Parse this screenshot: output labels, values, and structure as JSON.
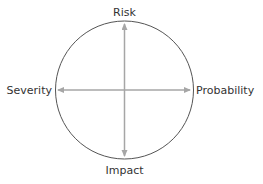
{
  "diagram": {
    "labels": {
      "top": "Risk",
      "bottom": "Impact",
      "left": "Severity",
      "right": "Probability"
    },
    "colors": {
      "circle": "#555555",
      "arrows": "#a6a6a6",
      "text": "#333333",
      "background": "#ffffff"
    }
  }
}
